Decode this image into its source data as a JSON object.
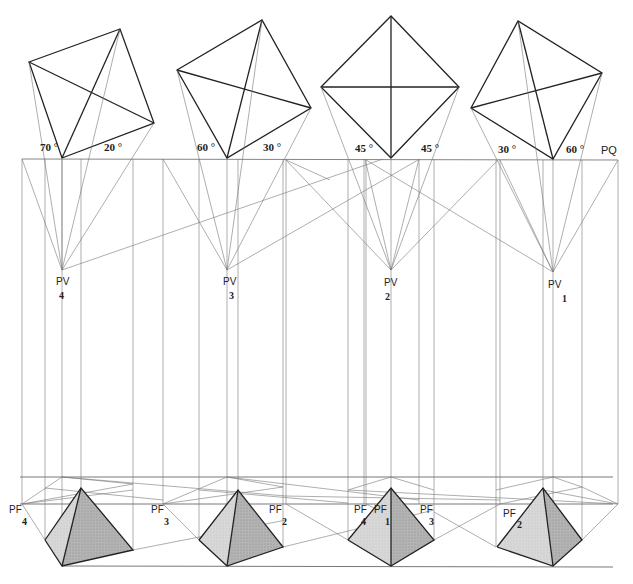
{
  "diagram": {
    "picture_plane_label": "PQ",
    "views": [
      {
        "id": 4,
        "angles": [
          "70 °",
          "20 °"
        ],
        "station_point_label": "PV",
        "station_point_number": "4",
        "vanishing_labels": [
          {
            "text": "PF",
            "num": "4"
          }
        ]
      },
      {
        "id": 3,
        "angles": [
          "60 °",
          "30 °"
        ],
        "station_point_label": "PV",
        "station_point_number": "3",
        "vanishing_labels": [
          {
            "text": "PF",
            "num": "3"
          },
          {
            "text": "PF",
            "num": "2"
          }
        ]
      },
      {
        "id": 2,
        "angles": [
          "45 °",
          "45 °"
        ],
        "station_point_label": "PV",
        "station_point_number": "2",
        "vanishing_labels": [
          {
            "text": "PF",
            "num": "4"
          },
          {
            "text": "PF",
            "num": "1"
          },
          {
            "text": "PF",
            "num": "3"
          }
        ]
      },
      {
        "id": 1,
        "angles": [
          "30 °",
          "60 °"
        ],
        "station_point_label": "PV",
        "station_point_number": "1",
        "vanishing_labels": [
          {
            "text": "PF",
            "num": "2"
          }
        ]
      }
    ],
    "colors": {
      "line": "#555555",
      "bold_line": "#222222",
      "face_light": "#d6d6d6",
      "face_dark": "#a9a9a9",
      "background": "#ffffff"
    }
  }
}
